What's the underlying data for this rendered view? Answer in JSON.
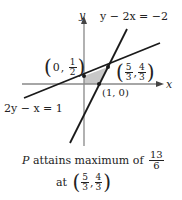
{
  "diagram": {
    "axes": {
      "x_label": "x",
      "y_label": "y"
    },
    "lines": [
      {
        "id": "line1",
        "equation": "2y − x = 1"
      },
      {
        "id": "line2",
        "equation": "y − 2x = −2"
      }
    ],
    "points": [
      {
        "id": "p_y_intercept",
        "x": "0",
        "y_num": "1",
        "y_den": "2"
      },
      {
        "id": "p_x_intercept",
        "label": "(1, 0)"
      },
      {
        "id": "p_intersection",
        "x_num": "5",
        "x_den": "3",
        "y_num": "4",
        "y_den": "3"
      }
    ],
    "colors": {
      "line": "#1a1a1a",
      "axis": "#888888",
      "shaded": "#c8c8c8"
    }
  },
  "caption": {
    "line1_prefix": "P",
    "line1_text": " attains maximum of ",
    "max_num": "13",
    "max_den": "6",
    "line2_prefix": "at",
    "at_x_num": "5",
    "at_x_den": "3",
    "at_y_num": "4",
    "at_y_den": "3"
  }
}
